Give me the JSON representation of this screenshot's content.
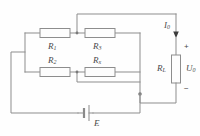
{
  "figure": {
    "background_color": "#fefefe",
    "wire_color": "#8d8d8d",
    "label_color": "#4a4a4a"
  },
  "components": {
    "r1": {
      "label": "R",
      "subscript": "1",
      "name": "resistor-r1"
    },
    "r3": {
      "label": "R",
      "subscript": "3",
      "name": "resistor-r3"
    },
    "r2": {
      "label": "R",
      "subscript": "2",
      "name": "resistor-r2"
    },
    "rx": {
      "label": "R",
      "subscript": "x",
      "name": "resistor-rx"
    },
    "rl": {
      "label": "R",
      "subscript": "L",
      "name": "load-resistor-rl"
    },
    "battery": {
      "label": "E",
      "name": "battery-e"
    }
  },
  "annotations": {
    "current": {
      "label": "I",
      "subscript": "0",
      "name": "current-i0"
    },
    "voltage": {
      "label": "U",
      "subscript": "0",
      "name": "voltage-u0"
    },
    "plus": "+",
    "minus": "−"
  }
}
